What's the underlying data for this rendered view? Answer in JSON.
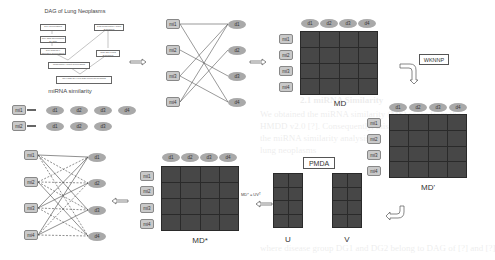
{
  "background_ghost_text": [
    "2.1 miRNA Similarity",
    "We obtained the miRNA similarity (MS) score from the",
    "HMDD v2.0 [?]. Consequently, this approach is",
    "the miRNA similarity analysis on",
    "lung neoplasms",
    "where disease group DG1 and DG2 belong to DAG of [?] and [?]"
  ],
  "dag": {
    "title": "DAG of Lung Neoplasms",
    "nodes": [
      "C04 Neoplasms",
      "C04.588 Neoplasms by Site",
      "C04.588.894 Thoracic Neoplasms",
      "C08 Respiratory Tract Diseases",
      "C08.381 Lung Diseases",
      "Respiratory Tract Neoplasms",
      "C04.588.894.797.520 Lung Neoplasms"
    ],
    "similarity_label": "miRNA similarity"
  },
  "similarity": {
    "rows": [
      {
        "mirna": "mi1",
        "diseases": [
          "d1",
          "d2",
          "d3",
          "d4"
        ]
      },
      {
        "mirna": "mi2",
        "diseases": [
          "d1",
          "d2",
          "d3"
        ]
      }
    ]
  },
  "bipartite1": {
    "mirnas": [
      "mi1",
      "mi2",
      "mi3",
      "mi4"
    ],
    "diseases": [
      "d1",
      "d2",
      "d3",
      "d4"
    ]
  },
  "md": {
    "label": "MD",
    "cols": [
      "d1",
      "d2",
      "d3",
      "d4"
    ],
    "rows": [
      "mi1",
      "mi2",
      "mi3",
      "mi4"
    ]
  },
  "wknnp": {
    "label": "WKNNP"
  },
  "md_prime": {
    "label": "MD'",
    "cols": [
      "d1",
      "d2",
      "d3",
      "d4"
    ],
    "rows": [
      "mi1",
      "mi2",
      "mi3",
      "mi4"
    ]
  },
  "pmda": {
    "label": "PMDA",
    "u_label": "U",
    "v_label": "V",
    "plus": "+"
  },
  "formula": {
    "text": "MD* = UVᵀ"
  },
  "md_star": {
    "label": "MD*",
    "cols": [
      "d1",
      "d2",
      "d3",
      "d4"
    ],
    "rows": [
      "mi1",
      "mi2",
      "mi3",
      "mi4"
    ]
  },
  "bipartite2": {
    "mirnas": [
      "mi1",
      "mi2",
      "mi3",
      "mi4"
    ],
    "diseases": [
      "d1",
      "d2",
      "d3",
      "d4"
    ]
  },
  "colors": {
    "matrix_cell": "#474747",
    "matrix_grid": "#2a2a2a",
    "node_fill": "#c9c9c9",
    "disease_fill": "#a9a9a9"
  }
}
